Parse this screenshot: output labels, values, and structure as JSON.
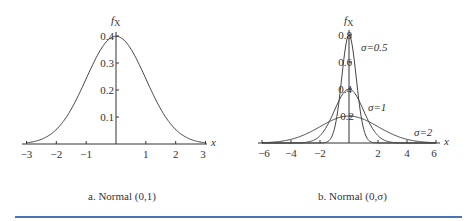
{
  "chart_data": [
    {
      "type": "line",
      "title": "a. Normal (0,1)",
      "ylabel": "f_X",
      "xlabel": "x",
      "xlim": [
        -3,
        3
      ],
      "ylim": [
        0,
        0.4
      ],
      "x_ticks": [
        "-3",
        "-2",
        "-1",
        "1",
        "2",
        "3"
      ],
      "y_ticks": [
        "0.1",
        "0.2",
        "0.3",
        "0.4"
      ],
      "grid": false,
      "series": [
        {
          "name": "N(0,1)",
          "mu": 0,
          "sigma": 1,
          "peak": 0.399
        }
      ]
    },
    {
      "type": "line",
      "title": "b. Normal (0,σ)",
      "ylabel": "f_X",
      "xlabel": "x",
      "xlim": [
        -6,
        6
      ],
      "ylim": [
        0,
        0.8
      ],
      "x_ticks": [
        "-6",
        "-4",
        "-2",
        "2",
        "4",
        "6"
      ],
      "y_ticks": [
        "0.2",
        "0.4",
        "0.6",
        "0.8"
      ],
      "grid": false,
      "series": [
        {
          "name": "σ=0.5",
          "mu": 0,
          "sigma": 0.5,
          "peak": 0.798
        },
        {
          "name": "σ=1",
          "mu": 0,
          "sigma": 1,
          "peak": 0.399
        },
        {
          "name": "σ=2",
          "mu": 0,
          "sigma": 2,
          "peak": 0.199
        }
      ]
    }
  ],
  "left": {
    "ylabel": "f",
    "ylabel_sub": "X",
    "xlabel": "x",
    "caption": "a. Normal (0,1)",
    "x_ticks": [
      "−3",
      "−2",
      "−1",
      "1",
      "2",
      "3"
    ],
    "y_ticks": [
      "0.1",
      "0.2",
      "0.3",
      "0.4"
    ]
  },
  "right": {
    "ylabel": "f",
    "ylabel_sub": "X",
    "xlabel": "x",
    "caption": "b. Normal (0,σ)",
    "x_ticks": [
      "−6",
      "−4",
      "−2",
      "2",
      "4",
      "6"
    ],
    "y_ticks": [
      "0.2",
      "0.4",
      "0.6",
      "0.8"
    ],
    "labels": [
      "σ=0.5",
      "σ=1",
      "σ=2"
    ]
  },
  "colors": {
    "rule": "#4a74b8",
    "ink": "#333333"
  }
}
